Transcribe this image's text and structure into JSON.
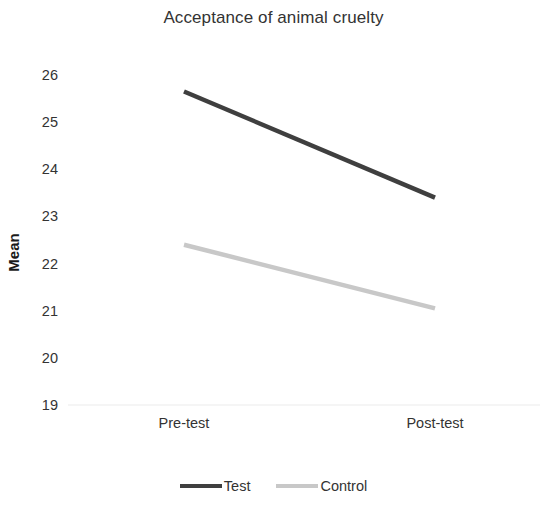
{
  "chart_data": {
    "type": "line",
    "title": "Acceptance of animal cruelty",
    "xlabel": "",
    "ylabel": "Mean",
    "categories": [
      "Pre-test",
      "Post-test"
    ],
    "ylim": [
      19,
      26
    ],
    "yticks": [
      26,
      25,
      24,
      23,
      22,
      21,
      20,
      19
    ],
    "grid": false,
    "baseline_gridline_at": 19,
    "legend_position": "bottom",
    "series": [
      {
        "name": "Test",
        "values": [
          25.65,
          23.4
        ],
        "color": "#3f3f3f"
      },
      {
        "name": "Control",
        "values": [
          22.4,
          21.05
        ],
        "color": "#c8c8c8"
      }
    ]
  },
  "axis": {
    "y_title": "Mean",
    "y_tick_labels": [
      "26",
      "25",
      "24",
      "23",
      "22",
      "21",
      "20",
      "19"
    ],
    "x_tick_labels": [
      "Pre-test",
      "Post-test"
    ]
  },
  "legend": {
    "items": [
      {
        "label": "Test"
      },
      {
        "label": "Control"
      }
    ]
  }
}
